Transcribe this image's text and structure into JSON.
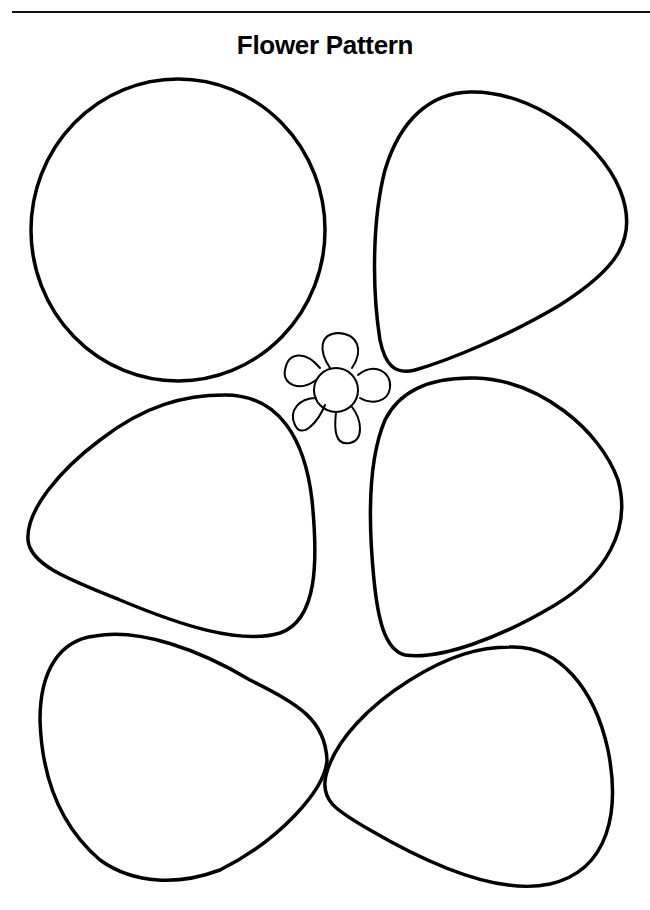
{
  "page": {
    "title": "Flower Pattern",
    "stroke_color": "#000000",
    "background": "#ffffff"
  },
  "shapes": [
    {
      "id": "large-round-petal",
      "kind": "circle"
    },
    {
      "id": "petal-top-right",
      "kind": "rounded-triangle"
    },
    {
      "id": "petal-middle-left",
      "kind": "rounded-triangle"
    },
    {
      "id": "petal-middle-right",
      "kind": "rounded-triangle"
    },
    {
      "id": "petal-bottom-left",
      "kind": "rounded-triangle"
    },
    {
      "id": "petal-bottom-right",
      "kind": "rounded-triangle"
    },
    {
      "id": "flower-example-icon",
      "kind": "small flower with 5 petals"
    }
  ]
}
